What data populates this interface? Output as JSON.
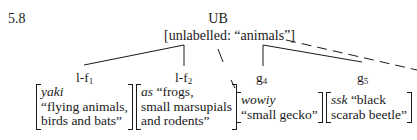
{
  "example_number": "5.8",
  "root": {
    "label": "UB",
    "description": "[unlabelled: “animals”]"
  },
  "nodes": [
    {
      "label_main": "l-f",
      "label_sub": "1",
      "gloss_word": "yaki",
      "gloss_lines": [
        "“flying animals,",
        "birds and bats”"
      ]
    },
    {
      "label_main": "l-f",
      "label_sub": "2",
      "gloss_word": "as",
      "gloss_inline": " “frogs,",
      "gloss_lines": [
        "small marsupials",
        "and rodents”"
      ]
    },
    {
      "label_main": "g",
      "label_sub": "4",
      "gloss_word": "wowiy",
      "gloss_lines": [
        "“small gecko”"
      ]
    },
    {
      "label_main": "g",
      "label_sub": "5",
      "gloss_word": "ssk",
      "gloss_inline": " “black",
      "gloss_lines": [
        "scarab beetle”"
      ]
    }
  ]
}
